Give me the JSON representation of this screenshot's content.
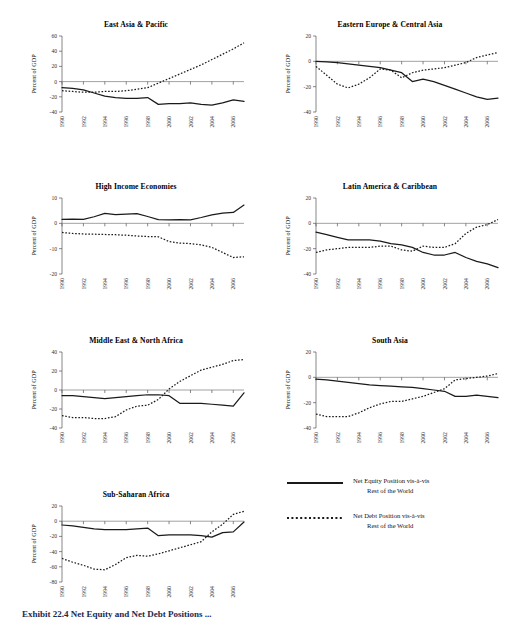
{
  "figure": {
    "caption": "Exhibit 22.4   Net Equity and Net Debt Positions ...",
    "ylabel": "Percent of GDP",
    "xticklabels": [
      "1990",
      "1992",
      "1994",
      "1996",
      "1998",
      "2000",
      "2002",
      "2004",
      "2006"
    ],
    "line_color": "#1a1a1a",
    "zero_line_color": "#8a8a8a"
  },
  "legend": {
    "items": [
      {
        "style": "solid",
        "line1": "Net Equity Position vis-à-vis",
        "line2": "Rest of the World"
      },
      {
        "style": "dotted",
        "line1": "Net Debt Position vis-à-vis",
        "line2": "Rest of the World"
      }
    ]
  },
  "chart_data": [
    {
      "type": "line",
      "title": "East Asia & Pacific",
      "xlabel": "",
      "ylabel": "Percent of GDP",
      "x": [
        1990,
        1991,
        1992,
        1993,
        1994,
        1995,
        1996,
        1997,
        1998,
        1999,
        2000,
        2001,
        2002,
        2003,
        2004,
        2005,
        2006,
        2007
      ],
      "xlim": [
        1990,
        2007
      ],
      "ylim": [
        -40,
        60
      ],
      "yticks": [
        60,
        40,
        20,
        0,
        -20,
        -40
      ],
      "grid": false,
      "series": [
        {
          "name": "Net Equity Position vis-à-vis Rest of the World",
          "style": "solid",
          "values": [
            -8,
            -9,
            -11,
            -15,
            -19,
            -21,
            -22,
            -22,
            -21,
            -30,
            -29,
            -29,
            -28,
            -30,
            -31,
            -28,
            -24,
            -26,
            -22
          ]
        },
        {
          "name": "Net Debt Position vis-à-vis Rest of the World",
          "style": "dotted",
          "values": [
            -12,
            -13,
            -14,
            -14,
            -13,
            -13,
            -12,
            -10,
            -8,
            -2,
            4,
            10,
            16,
            22,
            29,
            36,
            43,
            51
          ]
        }
      ]
    },
    {
      "type": "line",
      "title": "Eastern Europe & Central Asia",
      "xlabel": "",
      "ylabel": "Percent of GDP",
      "x": [
        1990,
        1991,
        1992,
        1993,
        1994,
        1995,
        1996,
        1997,
        1998,
        1999,
        2000,
        2001,
        2002,
        2003,
        2004,
        2005,
        2006,
        2007
      ],
      "xlim": [
        1990,
        2007
      ],
      "ylim": [
        -40,
        20
      ],
      "yticks": [
        20,
        0,
        -20,
        -40
      ],
      "grid": false,
      "series": [
        {
          "name": "Net Equity Position vis-à-vis Rest of the World",
          "style": "solid",
          "values": [
            0,
            -0.5,
            -1,
            -2,
            -3,
            -4,
            -5,
            -7,
            -9,
            -16,
            -14,
            -16,
            -19,
            -22,
            -25,
            -28,
            -30,
            -29
          ]
        },
        {
          "name": "Net Debt Position vis-à-vis Rest of the World",
          "style": "dotted",
          "values": [
            -4,
            -11,
            -18,
            -21,
            -18,
            -13,
            -6,
            -7,
            -13,
            -9,
            -7,
            -6,
            -5,
            -3,
            -1,
            3,
            5,
            7
          ]
        }
      ]
    },
    {
      "type": "line",
      "title": "High Income Economies",
      "xlabel": "",
      "ylabel": "Percent of GDP",
      "x": [
        1990,
        1991,
        1992,
        1993,
        1994,
        1995,
        1996,
        1997,
        1998,
        1999,
        2000,
        2001,
        2002,
        2003,
        2004,
        2005,
        2006,
        2007
      ],
      "xlim": [
        1990,
        2007
      ],
      "ylim": [
        -20,
        10
      ],
      "yticks": [
        10,
        0,
        -10,
        -20
      ],
      "grid": false,
      "series": [
        {
          "name": "Net Equity Position vis-à-vis Rest of the World",
          "style": "solid",
          "values": [
            1.6,
            1.7,
            1.6,
            2.6,
            3.9,
            3.4,
            3.6,
            3.8,
            2.7,
            1.5,
            1.4,
            1.5,
            1.4,
            2.3,
            3.3,
            4.0,
            4.3,
            7.2
          ]
        },
        {
          "name": "Net Debt Position vis-à-vis Rest of the World",
          "style": "dotted",
          "values": [
            -3.6,
            -4.0,
            -4.2,
            -4.3,
            -4.4,
            -4.5,
            -4.7,
            -5.0,
            -5.2,
            -5.3,
            -7.2,
            -7.8,
            -8.0,
            -8.5,
            -9.5,
            -11.5,
            -13.5,
            -13.2
          ]
        }
      ]
    },
    {
      "type": "line",
      "title": "Latin America & Caribbean",
      "xlabel": "",
      "ylabel": "Percent of GDP",
      "x": [
        1990,
        1991,
        1992,
        1993,
        1994,
        1995,
        1996,
        1997,
        1998,
        1999,
        2000,
        2001,
        2002,
        2003,
        2004,
        2005,
        2006,
        2007
      ],
      "xlim": [
        1990,
        2007
      ],
      "ylim": [
        -40,
        20
      ],
      "yticks": [
        20,
        0,
        -20,
        -40
      ],
      "grid": false,
      "series": [
        {
          "name": "Net Equity Position vis-à-vis Rest of the World",
          "style": "solid",
          "values": [
            -7,
            -9,
            -11,
            -13,
            -13,
            -13,
            -14,
            -16,
            -17,
            -19,
            -23,
            -25,
            -25,
            -23,
            -27,
            -30,
            -32,
            -35
          ]
        },
        {
          "name": "Net Debt Position vis-à-vis Rest of the World",
          "style": "dotted",
          "values": [
            -23,
            -21,
            -20,
            -19,
            -19,
            -19,
            -18,
            -18,
            -21,
            -22,
            -18,
            -19,
            -19,
            -16,
            -8,
            -3,
            -1,
            3
          ]
        }
      ]
    },
    {
      "type": "line",
      "title": "Middle East & North Africa",
      "xlabel": "",
      "ylabel": "Percent of GDP",
      "x": [
        1990,
        1991,
        1992,
        1993,
        1994,
        1995,
        1996,
        1997,
        1998,
        1999,
        2000,
        2001,
        2002,
        2003,
        2004,
        2005,
        2006,
        2007
      ],
      "xlim": [
        1990,
        2007
      ],
      "ylim": [
        -40,
        40
      ],
      "yticks": [
        40,
        20,
        0,
        -20,
        -40
      ],
      "grid": false,
      "series": [
        {
          "name": "Net Equity Position vis-à-vis Rest of the World",
          "style": "solid",
          "values": [
            -6,
            -6,
            -7,
            -8,
            -9,
            -8,
            -7,
            -6,
            -5,
            -5,
            -6,
            -14,
            -14,
            -14,
            -15,
            -16,
            -17,
            -3
          ]
        },
        {
          "name": "Net Debt Position vis-à-vis Rest of the World",
          "style": "dotted",
          "values": [
            -27,
            -29,
            -29,
            -30,
            -30,
            -28,
            -21,
            -17,
            -16,
            -10,
            1,
            9,
            15,
            21,
            24,
            27,
            31,
            32
          ]
        }
      ]
    },
    {
      "type": "line",
      "title": "South Asia",
      "xlabel": "",
      "ylabel": "Percent of GDP",
      "x": [
        1990,
        1991,
        1992,
        1993,
        1994,
        1995,
        1996,
        1997,
        1998,
        1999,
        2000,
        2001,
        2002,
        2003,
        2004,
        2005,
        2006,
        2007
      ],
      "xlim": [
        1990,
        2007
      ],
      "ylim": [
        -40,
        20
      ],
      "yticks": [
        20,
        0,
        -20,
        -40
      ],
      "grid": false,
      "series": [
        {
          "name": "Net Equity Position vis-à-vis Rest of the World",
          "style": "solid",
          "values": [
            -1.5,
            -2,
            -3,
            -4,
            -5,
            -6,
            -6.5,
            -7,
            -7.5,
            -8,
            -9,
            -10,
            -11,
            -15,
            -15,
            -14,
            -15,
            -16
          ]
        },
        {
          "name": "Net Debt Position vis-à-vis Rest of the World",
          "style": "dotted",
          "values": [
            -29,
            -31,
            -31,
            -31,
            -28,
            -24,
            -21,
            -19,
            -19,
            -17,
            -15,
            -12,
            -9,
            -2,
            -1,
            0,
            1,
            3
          ]
        }
      ]
    },
    {
      "type": "line",
      "title": "Sub-Saharan Africa",
      "xlabel": "",
      "ylabel": "Percent of GDP",
      "x": [
        1990,
        1991,
        1992,
        1993,
        1994,
        1995,
        1996,
        1997,
        1998,
        1999,
        2000,
        2001,
        2002,
        2003,
        2004,
        2005,
        2006,
        2007
      ],
      "xlim": [
        1990,
        2007
      ],
      "ylim": [
        -80,
        20
      ],
      "yticks": [
        20,
        0,
        -20,
        -40,
        -60,
        -80
      ],
      "grid": false,
      "series": [
        {
          "name": "Net Equity Position vis-à-vis Rest of the World",
          "style": "solid",
          "values": [
            -5,
            -6,
            -8,
            -10,
            -11,
            -11,
            -11,
            -10,
            -9,
            -19,
            -18,
            -18,
            -18,
            -19,
            -21,
            -15,
            -14,
            -1
          ]
        },
        {
          "name": "Net Debt Position vis-à-vis Rest of the World",
          "style": "dotted",
          "values": [
            -49,
            -54,
            -58,
            -63,
            -64,
            -57,
            -48,
            -45,
            -46,
            -43,
            -39,
            -35,
            -31,
            -27,
            -14,
            -4,
            9,
            13
          ]
        }
      ]
    }
  ]
}
